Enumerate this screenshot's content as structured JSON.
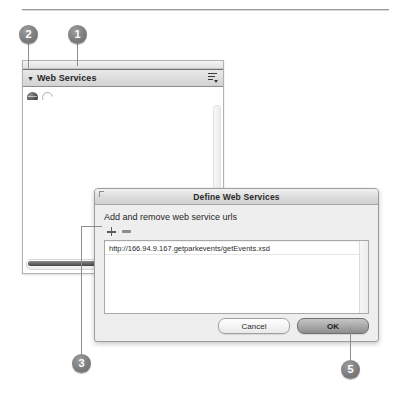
{
  "callouts": [
    {
      "id": "1",
      "label": "1"
    },
    {
      "id": "2",
      "label": "2"
    },
    {
      "id": "3",
      "label": "3"
    },
    {
      "id": "5",
      "label": "5"
    }
  ],
  "panel": {
    "title": "Web Services",
    "disclosure_glyph": "▼",
    "icons": {
      "globe": "globe-icon",
      "refresh": "refresh-icon",
      "panel_menu": "panel-menu-icon"
    }
  },
  "dialog": {
    "title": "Define Web Services",
    "label": "Add and remove web service urls",
    "add_icon": "plus-icon",
    "remove_icon": "minus-icon",
    "urls": [
      "http://166.94.9.167.getparkevents/getEvents.xsd"
    ],
    "buttons": {
      "cancel": "Cancel",
      "ok": "OK"
    }
  }
}
